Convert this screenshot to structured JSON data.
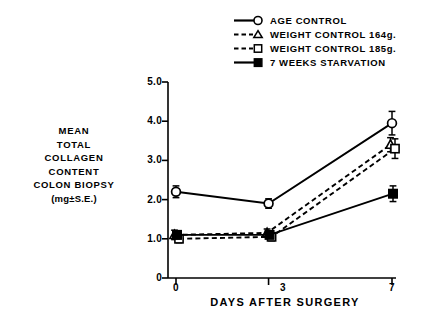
{
  "chart_data": {
    "type": "line",
    "title": "",
    "xlabel": "DAYS AFTER SURGERY",
    "ylabel": "MEAN TOTAL COLLAGEN CONTENT COLON BIOPSY (mg±S.E.)",
    "ylabel_lines": [
      "MEAN",
      "TOTAL",
      "COLLAGEN",
      "CONTENT",
      "COLON BIOPSY",
      "(mg±S.E.)"
    ],
    "x": [
      0,
      3,
      7
    ],
    "xtick_labels": [
      "0",
      "3",
      "7"
    ],
    "ytick_labels": [
      "0",
      "1.0",
      "2.0",
      "3.0",
      "4.0",
      "5.0"
    ],
    "ytick_values": [
      0,
      1.0,
      2.0,
      3.0,
      4.0,
      5.0
    ],
    "xlim": [
      0,
      7
    ],
    "ylim": [
      0,
      5.0
    ],
    "grid": false,
    "legend_position": "top-right",
    "error_bar_kind": "S.E.",
    "series": [
      {
        "name": "AGE CONTROL",
        "marker": "open-circle",
        "line": "solid",
        "values": [
          2.2,
          1.9,
          3.95
        ],
        "errors": [
          0.15,
          0.12,
          0.3
        ]
      },
      {
        "name": "WEIGHT CONTROL 164g.",
        "marker": "open-triangle",
        "line": "dashed",
        "values": [
          1.1,
          1.15,
          3.4
        ],
        "errors": [
          0.12,
          0.1,
          0.18
        ]
      },
      {
        "name": "WEIGHT CONTROL 185g.",
        "marker": "open-square",
        "line": "dashed",
        "values": [
          1.0,
          1.05,
          3.3
        ],
        "errors": [
          0.1,
          0.1,
          0.25
        ]
      },
      {
        "name": "7 WEEKS STARVATION",
        "marker": "filled-square",
        "line": "solid",
        "values": [
          1.1,
          1.1,
          2.15
        ],
        "errors": [
          0.1,
          0.08,
          0.2
        ]
      }
    ]
  },
  "legend": {
    "items": [
      {
        "label": "AGE CONTROL"
      },
      {
        "label": "WEIGHT CONTROL 164g."
      },
      {
        "label": "WEIGHT CONTROL 185g."
      },
      {
        "label": "7 WEEKS STARVATION"
      }
    ]
  },
  "axes": {
    "y_title_lines": [
      "MEAN",
      "TOTAL",
      "COLLAGEN",
      "CONTENT",
      "COLON BIOPSY",
      "(mg±S.E.)"
    ],
    "x_title": "DAYS AFTER SURGERY",
    "y_ticks": [
      "5.0",
      "4.0",
      "3.0",
      "2.0",
      "1.0",
      "0"
    ],
    "x_ticks": [
      "0",
      "3",
      "7"
    ]
  },
  "colors": {
    "ink": "#000000",
    "background": "#ffffff"
  }
}
